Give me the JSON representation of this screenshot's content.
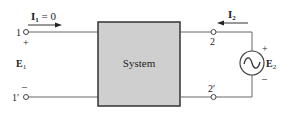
{
  "diagram": {
    "system_block": {
      "label": "System",
      "fill": "#cfcfcf",
      "stroke": "#333333"
    },
    "port1": {
      "top_terminal": "1",
      "bottom_terminal": "1′",
      "voltage_label": "E",
      "voltage_sub": "1",
      "plus": "+",
      "minus": "–",
      "current_label": "I",
      "current_sub": "1",
      "current_value": " = 0"
    },
    "port2": {
      "top_terminal": "2",
      "bottom_terminal": "2′",
      "current_label": "I",
      "current_sub": "2",
      "source_label": "E",
      "source_sub": "2",
      "plus": "+",
      "minus": "–",
      "source_type": "ac-voltage-source"
    },
    "colors": {
      "wire": "#555555",
      "text": "#222222"
    }
  }
}
